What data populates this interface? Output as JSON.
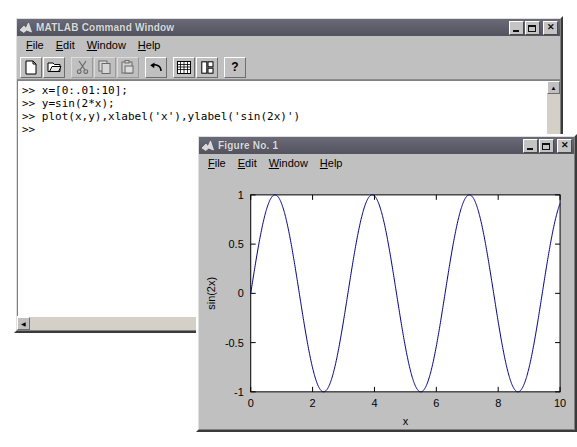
{
  "command_window": {
    "title": "MATLAB Command Window",
    "icon": "matlab-icon",
    "menus": [
      {
        "label": "File",
        "mnemonic": "F"
      },
      {
        "label": "Edit",
        "mnemonic": "E"
      },
      {
        "label": "Window",
        "mnemonic": "W"
      },
      {
        "label": "Help",
        "mnemonic": "H"
      }
    ],
    "toolbar": [
      {
        "name": "new-file-icon",
        "enabled": true
      },
      {
        "name": "open-file-icon",
        "enabled": true
      },
      {
        "name": "cut-icon",
        "enabled": false
      },
      {
        "name": "copy-icon",
        "enabled": false
      },
      {
        "name": "paste-icon",
        "enabled": false
      },
      {
        "name": "undo-icon",
        "enabled": true
      },
      {
        "name": "workspace-icon",
        "enabled": true
      },
      {
        "name": "path-browser-icon",
        "enabled": true
      },
      {
        "name": "help-question-icon",
        "enabled": true,
        "glyph": "?"
      }
    ],
    "window_buttons": [
      "minimize",
      "maximize",
      "close"
    ],
    "transcript": [
      ">> x=[0:.01:10];",
      ">> y=sin(2*x);",
      ">> plot(x,y),xlabel('x'),ylabel('sin(2x)')",
      ">>"
    ]
  },
  "figure_window": {
    "title": "Figure No. 1",
    "icon": "matlab-icon",
    "menus": [
      {
        "label": "File",
        "mnemonic": "F"
      },
      {
        "label": "Edit",
        "mnemonic": "E"
      },
      {
        "label": "Window",
        "mnemonic": "W"
      },
      {
        "label": "Help",
        "mnemonic": "H"
      }
    ],
    "window_buttons": [
      "minimize",
      "maximize",
      "close"
    ]
  },
  "chart_data": {
    "type": "line",
    "title": "",
    "xlabel": "x",
    "ylabel": "sin(2x)",
    "xlim": [
      0,
      10
    ],
    "ylim": [
      -1,
      1
    ],
    "xticks": [
      0,
      2,
      4,
      6,
      8,
      10
    ],
    "xticklabels": [
      "0",
      "2",
      "4",
      "6",
      "8",
      "10"
    ],
    "yticks": [
      -1,
      -0.5,
      0,
      0.5,
      1
    ],
    "yticklabels": [
      "-1",
      "-0.5",
      "0",
      "0.5",
      "1"
    ],
    "grid": false,
    "legend": null,
    "series": [
      {
        "name": "sin(2x)",
        "color": "#000080",
        "expression": "y = sin(2*x)",
        "x_start": 0,
        "x_end": 10,
        "x_step": 0.01,
        "amplitude": 1,
        "frequency": 2,
        "period": 3.14159,
        "n_points": 1001
      }
    ],
    "colors": {
      "axes_background": "#ffffff",
      "figure_background": "#c0c0c0",
      "line": "#000080",
      "axis": "#000000"
    }
  },
  "desktop": {
    "background": "#ffffff"
  }
}
